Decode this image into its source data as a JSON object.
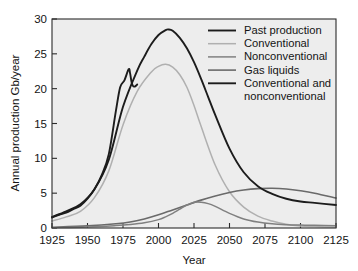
{
  "figure": {
    "background_color": "#ffffff",
    "plot_background_color": "#ededed",
    "frame_color": "#2b2b2b"
  },
  "axes": {
    "y_title": "Annual production Gb/year",
    "x_title": "Year",
    "y_ticks": [
      "0",
      "5",
      "10",
      "15",
      "20",
      "25",
      "30"
    ],
    "x_ticks": [
      "1925",
      "1950",
      "1975",
      "2000",
      "2025",
      "2050",
      "2075",
      "2100",
      "2125"
    ]
  },
  "legend": {
    "position": "top-right-inside",
    "items": [
      {
        "label": "Past production",
        "color": "#1c1c1c",
        "width": 1.9
      },
      {
        "label": "Conventional",
        "color": "#b0b0b0",
        "width": 1.5
      },
      {
        "label": "Nonconventional",
        "color": "#808080",
        "width": 1.5
      },
      {
        "label": "Gas liquids",
        "color": "#6a6a6a",
        "width": 1.6
      },
      {
        "label": "Conventional and",
        "label2": "nonconventional",
        "color": "#1c1c1c",
        "width": 1.9
      }
    ]
  },
  "chart_data": {
    "type": "line",
    "title": "",
    "xlabel": "Year",
    "ylabel": "Annual production Gb/year",
    "xlim": [
      1925,
      2125
    ],
    "ylim": [
      0,
      30
    ],
    "xticks": [
      1925,
      1950,
      1975,
      2000,
      2025,
      2050,
      2075,
      2100,
      2125
    ],
    "yticks": [
      0,
      5,
      10,
      15,
      20,
      25,
      30
    ],
    "grid": false,
    "legend_position": "upper right",
    "series": [
      {
        "name": "Past production",
        "color": "#1c1c1c",
        "x": [
          1925,
          1930,
          1935,
          1940,
          1945,
          1950,
          1955,
          1960,
          1965,
          1970,
          1973,
          1976,
          1979,
          1980,
          1981,
          1982,
          1983,
          1984,
          1985
        ],
        "y": [
          1.5,
          1.9,
          2.2,
          2.7,
          3.2,
          4.2,
          5.6,
          7.6,
          10.6,
          16.8,
          20.2,
          21.2,
          22.8,
          22.2,
          21.0,
          20.4,
          20.3,
          20.4,
          20.6
        ]
      },
      {
        "name": "Conventional",
        "color": "#b0b0b0",
        "x": [
          1925,
          1935,
          1945,
          1955,
          1965,
          1975,
          1985,
          1995,
          2000,
          2005,
          2010,
          2015,
          2020,
          2025,
          2030,
          2040,
          2050,
          2060,
          2070,
          2080,
          2090,
          2100,
          2110,
          2125
        ],
        "y": [
          1.0,
          1.6,
          2.4,
          4.4,
          8.2,
          14.8,
          19.6,
          22.4,
          23.2,
          23.5,
          23.1,
          22.0,
          20.2,
          17.6,
          14.6,
          9.0,
          5.2,
          3.0,
          1.7,
          1.0,
          0.55,
          0.3,
          0.2,
          0.1
        ]
      },
      {
        "name": "Nonconventional",
        "color": "#808080",
        "x": [
          1925,
          1950,
          1970,
          1980,
          1990,
          2000,
          2005,
          2010,
          2015,
          2020,
          2025,
          2030,
          2035,
          2040,
          2050,
          2060,
          2070,
          2080,
          2090,
          2100,
          2110,
          2125
        ],
        "y": [
          0.05,
          0.15,
          0.35,
          0.5,
          0.75,
          1.2,
          1.6,
          2.1,
          2.7,
          3.3,
          3.7,
          3.7,
          3.5,
          3.1,
          2.1,
          1.3,
          0.85,
          0.6,
          0.48,
          0.42,
          0.38,
          0.33
        ]
      },
      {
        "name": "Gas liquids",
        "color": "#6a6a6a",
        "x": [
          1925,
          1950,
          1970,
          1980,
          1990,
          2000,
          2010,
          2020,
          2030,
          2040,
          2050,
          2060,
          2070,
          2080,
          2090,
          2100,
          2110,
          2125
        ],
        "y": [
          0.1,
          0.3,
          0.6,
          0.85,
          1.3,
          1.9,
          2.6,
          3.3,
          4.0,
          4.6,
          5.1,
          5.45,
          5.65,
          5.7,
          5.6,
          5.35,
          5.0,
          4.3
        ]
      },
      {
        "name": "Conventional and nonconventional",
        "color": "#1c1c1c",
        "x": [
          1925,
          1935,
          1945,
          1955,
          1965,
          1975,
          1985,
          1990,
          1995,
          2000,
          2005,
          2007,
          2010,
          2015,
          2020,
          2025,
          2030,
          2035,
          2040,
          2050,
          2060,
          2070,
          2080,
          2090,
          2100,
          2110,
          2125
        ],
        "y": [
          1.6,
          2.4,
          3.4,
          5.6,
          9.8,
          17.4,
          22.6,
          24.6,
          26.4,
          27.7,
          28.4,
          28.5,
          28.3,
          27.3,
          25.8,
          23.8,
          21.4,
          18.8,
          16.2,
          11.4,
          8.0,
          6.0,
          4.9,
          4.2,
          3.8,
          3.6,
          3.3
        ]
      }
    ],
    "annotations": [
      {
        "text": "1979 peak",
        "x": 1979,
        "y": 22.8
      },
      {
        "text": "1983 trough",
        "x": 1983,
        "y": 20.3
      }
    ]
  }
}
